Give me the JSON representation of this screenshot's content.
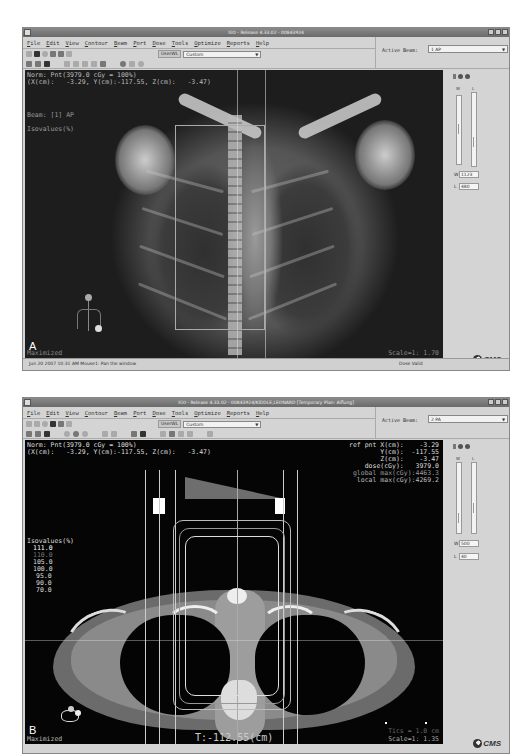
{
  "panels": [
    {
      "id": "A",
      "window_title": "XiO - Release 4.33.02 - 00843924",
      "window_title_right": "Aiflung",
      "menu": [
        "File",
        "Edit",
        "View",
        "Contour",
        "Beam",
        "Port",
        "Dose",
        "Tools",
        "Optimize",
        "Reports",
        "Help"
      ],
      "userlist_label": "UserWL",
      "userlist_value": "Custom",
      "active_beam_label": "Active Beam:",
      "active_beam_value": "1 AP",
      "overlay": {
        "norm_line": "Norm: Pnt(3979.0 cGy = 100%)",
        "coord_line": "(X(cm):   -3.29, Y(cm):-117.55, Z(cm):   -3.47)",
        "beam_label": "Beam: [1] AP",
        "isovalues_label": "Isovalues(%)",
        "maximized": "Maximized",
        "scale": "Scale=1: 1.70"
      },
      "wl": {
        "w_label": "W",
        "w_value": "1123",
        "l_label": "L",
        "l_value": "480",
        "col_w": "W",
        "col_l": "L"
      },
      "status": {
        "left": "Jun 20 2007 10:31 AM   Mouse1:  Pan the window",
        "right": "Dose Valid"
      },
      "panel_letter": "A",
      "logo": "CMS"
    },
    {
      "id": "B",
      "window_title": "XiO - Release 4.33.02 - 00843924/KIDDLE,LEONARD [Temporary Plan: Aiflung]",
      "menu": [
        "File",
        "Edit",
        "View",
        "Contour",
        "Beam",
        "Port",
        "Dose",
        "Tools",
        "Optimize",
        "Reports",
        "Help"
      ],
      "userlist_label": "UserWL",
      "userlist_value": "Custom",
      "active_beam_label": "Active Beam:",
      "active_beam_value": "2 PA",
      "overlay": {
        "norm_line": "Norm: Pnt(3979.0 cGy = 100%)",
        "coord_line": "(X(cm):   -3.29, Y(cm):-117.55, Z(cm):   -3.47)",
        "ref_pnt": [
          "ref pnt X(cm):    -3.29",
          "        Y(cm):  -117.55",
          "        Z(cm):    -3.47",
          "     dose(cGy):   3979.0",
          "global max(cGy):4463.3",
          " local max(cGy):4269.2"
        ],
        "isovalues_label": "Isovalues(%)",
        "isovalues": [
          "111.0",
          "110.0",
          "105.0",
          "100.0",
          "95.0",
          "90.0",
          "70.0"
        ],
        "maximized": "Maximized",
        "slice": "T:-112.55(cm)",
        "tics": "Tics = 1.0 cm",
        "scale": "Scale=1: 1.35"
      },
      "wl": {
        "w_label": "W",
        "w_value": "500",
        "l_label": "L",
        "l_value": "40",
        "col_w": "W",
        "col_l": "L"
      },
      "panel_letter": "B",
      "logo": "CMS"
    }
  ],
  "colors": {
    "window_bg": "#d4d4d4",
    "titlebar": "#7a7a7a",
    "viewport_a": "#1d1d1d",
    "viewport_b": "#050505",
    "overlay_text": "#e0e0e0",
    "iso_111": "#ffffff",
    "iso_110": "#888888"
  }
}
